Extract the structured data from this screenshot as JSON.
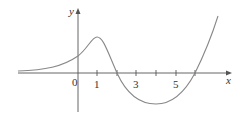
{
  "diagram": {
    "type": "function-graph",
    "axes": {
      "x_label": "x",
      "y_label": "y",
      "origin_label": "0"
    },
    "x_tick_labels": [
      "1",
      "3",
      "5"
    ],
    "x_ticks": [
      1,
      2,
      3,
      4,
      5,
      6
    ],
    "curve": {
      "description": "Smooth curve approaching 0 on the left, local maximum near x=1, crosses x-axis at x=2, local minimum near x=4, crosses x-axis at x=6, then increases",
      "color": "#888888"
    },
    "colors": {
      "axis": "#555555",
      "text": "#333333"
    }
  }
}
